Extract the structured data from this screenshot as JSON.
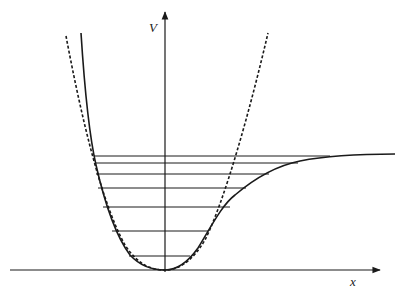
{
  "figure": {
    "type": "potential-energy-diagram",
    "axes": {
      "y_label": "V",
      "x_label": "x"
    },
    "colors": {
      "ink": "#1a1a1a",
      "background": "#ffffff"
    },
    "curves": [
      {
        "name": "morse-potential",
        "style": "solid"
      },
      {
        "name": "harmonic-potential",
        "style": "dashed"
      }
    ],
    "energy_levels": {
      "count": 7,
      "y_px": [
        256,
        231,
        207,
        188,
        174,
        163,
        156
      ],
      "left_x_px": [
        129,
        112,
        103,
        98,
        96,
        95,
        94
      ],
      "right_x_px": [
        190,
        208,
        230,
        245,
        268,
        297,
        330
      ]
    },
    "dissociation_asymptote_y_px": 154
  }
}
